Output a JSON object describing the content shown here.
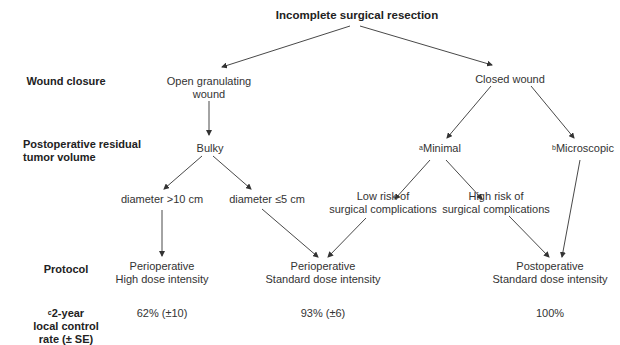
{
  "title": "Incomplete surgical resection",
  "row_labels": {
    "wound_closure": "Wound closure",
    "residual_volume_line1": "Postoperative residual",
    "residual_volume_line2": "tumor volume",
    "protocol": "Protocol",
    "control_sup": "c",
    "control_line1": "2-year",
    "control_line2": "local control",
    "control_line3": "rate (± SE)"
  },
  "nodes": {
    "open_wound_line1": "Open granulating",
    "open_wound_line2": "wound",
    "closed_wound": "Closed wound",
    "bulky": "Bulky",
    "minimal_sup": "a",
    "minimal": "Minimal",
    "microscopic_sup": "b",
    "microscopic": "Microscopic",
    "diam_gt10": "diameter >10 cm",
    "diam_le5": "diameter ≤5 cm",
    "low_risk_line1": "Low risk of",
    "low_risk_line2": "surgical complications",
    "high_risk_line1": "High risk of",
    "high_risk_line2": "surgical complications",
    "proto_high_line1": "Perioperative",
    "proto_high_line2": "High dose intensity",
    "proto_periop_std_line1": "Perioperative",
    "proto_periop_std_line2": "Standard dose intensity",
    "proto_postop_std_line1": "Postoperative",
    "proto_postop_std_line2": "Standard dose intensity"
  },
  "outcomes": {
    "high_dose": "62% (±10)",
    "periop_standard": "93% (±6)",
    "postop_standard": "100%"
  },
  "colors": {
    "text": "#333333",
    "lines": "#333333",
    "background": "#ffffff"
  }
}
